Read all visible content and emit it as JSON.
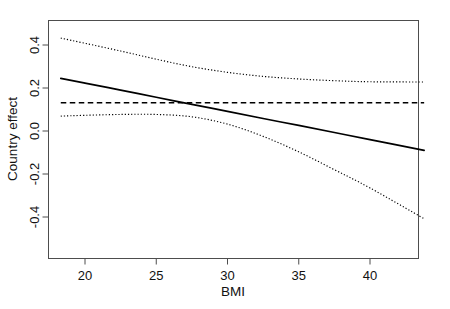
{
  "chart_data": {
    "type": "line",
    "title": "",
    "xlabel": "BMI",
    "ylabel": "Country effect",
    "xlim": [
      18.3,
      43.8
    ],
    "ylim": [
      -0.5,
      0.5
    ],
    "xticks": [
      20,
      25,
      30,
      35,
      40
    ],
    "xtick_labels": [
      "20",
      "25",
      "30",
      "35",
      "40"
    ],
    "yticks": [
      0.4,
      0.2,
      0.0,
      -0.2,
      -0.4
    ],
    "ytick_labels": [
      "0.4",
      "0.2",
      "0.0",
      "-0.2",
      "-0.4"
    ],
    "grid": false,
    "legend": "none",
    "series": [
      {
        "name": "fitted-effect",
        "style": "solid",
        "color": "#000000",
        "x": [
          18.3,
          20.0,
          22.5,
          25.0,
          27.5,
          30.0,
          32.5,
          35.0,
          37.5,
          40.0,
          43.8
        ],
        "values": [
          0.245,
          0.223,
          0.19,
          0.157,
          0.124,
          0.091,
          0.058,
          0.026,
          -0.007,
          -0.04,
          -0.09
        ]
      },
      {
        "name": "null-reference",
        "style": "dashed",
        "color": "#000000",
        "x": [
          18.3,
          43.8
        ],
        "values": [
          0.131,
          0.131
        ]
      },
      {
        "name": "upper-confidence-band",
        "style": "dotted",
        "color": "#000000",
        "x": [
          18.3,
          20.0,
          22.5,
          25.0,
          27.5,
          30.0,
          32.5,
          35.0,
          37.5,
          40.0,
          43.8
        ],
        "values": [
          0.432,
          0.408,
          0.372,
          0.334,
          0.299,
          0.273,
          0.254,
          0.242,
          0.234,
          0.229,
          0.228
        ]
      },
      {
        "name": "lower-confidence-band",
        "style": "dotted",
        "color": "#000000",
        "x": [
          18.3,
          20.0,
          22.5,
          25.0,
          27.5,
          30.0,
          32.5,
          35.0,
          37.5,
          40.0,
          43.8
        ],
        "values": [
          0.069,
          0.073,
          0.077,
          0.077,
          0.066,
          0.032,
          -0.025,
          -0.097,
          -0.18,
          -0.265,
          -0.408
        ]
      }
    ],
    "annotations": [],
    "crossing_point": {
      "x": 27.4,
      "y": 0.131
    }
  },
  "axis": {
    "x_title": "BMI",
    "y_title": "Country effect"
  }
}
